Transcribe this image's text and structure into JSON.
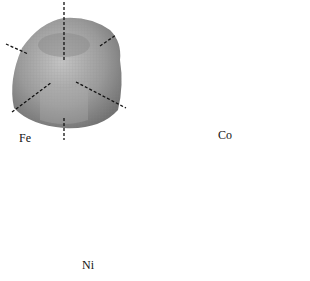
{
  "figure": {
    "panels": [
      {
        "label": "Fe",
        "shape": "cubic-lobed surface",
        "axes": "cubic <100> / <111> dashed"
      },
      {
        "label": "Co",
        "shape": "uniaxial spheroid with dimple",
        "axes": "single vertical c-axis dashed"
      },
      {
        "label": "Ni",
        "shape": "four-lobed surface",
        "axes": "<111> dashed pairs"
      }
    ],
    "colors": {
      "surface": "#9a9a9a",
      "surface_light": "#bdbdbd",
      "surface_dark": "#707070",
      "axis": "#111111",
      "background": "#ffffff"
    }
  }
}
